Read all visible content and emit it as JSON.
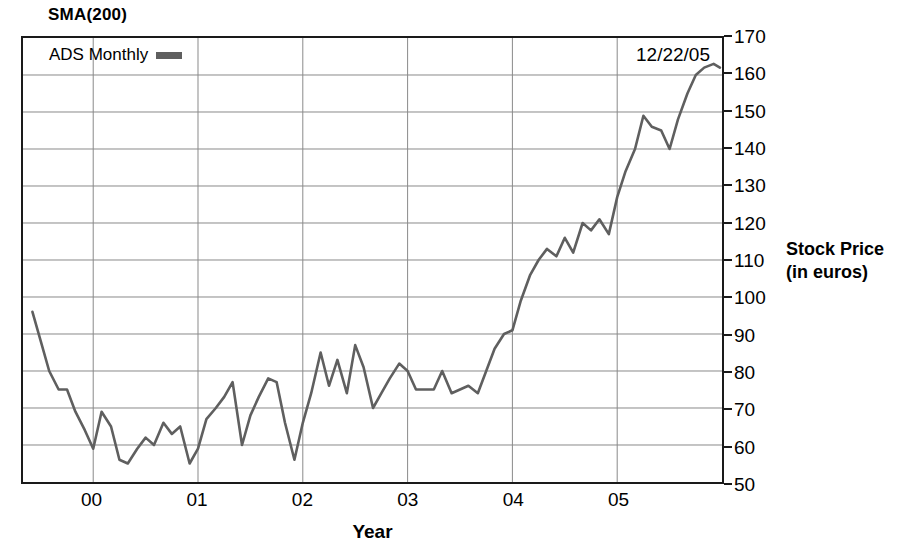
{
  "chart_data": {
    "type": "line",
    "title": "SMA(200)",
    "xlabel": "Year",
    "ylabel": "Stock Price\n(in euros)",
    "ylabel_lines": [
      "Stock Price",
      "(in euros)"
    ],
    "annotation": "12/22/05",
    "legend": {
      "position": "top-left-inside",
      "entries": [
        {
          "name": "ADS Monthly",
          "color": "#5f5f5f"
        }
      ]
    },
    "grid": true,
    "xlim": [
      1999.33,
      2006.0
    ],
    "ylim": [
      50,
      170
    ],
    "yticks": [
      170,
      160,
      150,
      140,
      130,
      120,
      110,
      100,
      90,
      80,
      70,
      60,
      50
    ],
    "xticks": [
      2000,
      2001,
      2002,
      2003,
      2004,
      2005
    ],
    "xtick_labels": [
      "00",
      "01",
      "02",
      "03",
      "04",
      "05"
    ],
    "series": [
      {
        "name": "ADS Monthly",
        "color": "#5f5f5f",
        "x": [
          1999.42,
          1999.5,
          1999.58,
          1999.67,
          1999.75,
          1999.83,
          1999.92,
          2000.0,
          2000.08,
          2000.17,
          2000.25,
          2000.33,
          2000.42,
          2000.5,
          2000.58,
          2000.67,
          2000.75,
          2000.83,
          2000.92,
          2001.0,
          2001.08,
          2001.17,
          2001.25,
          2001.33,
          2001.42,
          2001.5,
          2001.58,
          2001.67,
          2001.75,
          2001.83,
          2001.92,
          2002.0,
          2002.08,
          2002.17,
          2002.25,
          2002.33,
          2002.42,
          2002.5,
          2002.58,
          2002.67,
          2002.75,
          2002.83,
          2002.92,
          2003.0,
          2003.08,
          2003.17,
          2003.25,
          2003.33,
          2003.42,
          2003.5,
          2003.58,
          2003.67,
          2003.75,
          2003.83,
          2003.92,
          2004.0,
          2004.08,
          2004.17,
          2004.25,
          2004.33,
          2004.42,
          2004.5,
          2004.58,
          2004.67,
          2004.75,
          2004.83,
          2004.92,
          2005.0,
          2005.08,
          2005.17,
          2005.25,
          2005.33,
          2005.42,
          2005.5,
          2005.58,
          2005.67,
          2005.75,
          2005.83,
          2005.92,
          2005.98
        ],
        "values": [
          96,
          88,
          80,
          75,
          75,
          69,
          64,
          59,
          69,
          65,
          56,
          55,
          59,
          62,
          60,
          66,
          63,
          65,
          55,
          59,
          67,
          70,
          73,
          77,
          60,
          68,
          73,
          78,
          77,
          66,
          56,
          66,
          74,
          85,
          76,
          83,
          74,
          87,
          81,
          70,
          74,
          78,
          82,
          80,
          75,
          75,
          75,
          80,
          74,
          75,
          76,
          74,
          80,
          86,
          90,
          91,
          99,
          106,
          110,
          113,
          111,
          116,
          112,
          120,
          118,
          121,
          117,
          127,
          134,
          140,
          149,
          146,
          145,
          140,
          148,
          155,
          160,
          162,
          163,
          162
        ]
      }
    ]
  },
  "chart": {
    "title": "SMA(200)",
    "annotation": "12/22/05",
    "legend_label": "ADS Monthly",
    "y_axis_title_line1": "Stock Price",
    "y_axis_title_line2": "(in euros)",
    "x_axis_title": "Year"
  }
}
